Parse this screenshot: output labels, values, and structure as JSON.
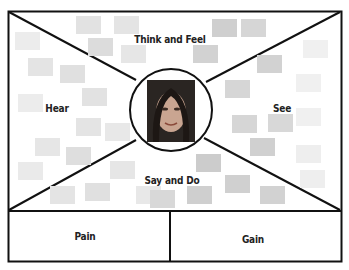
{
  "diagram": {
    "quadrants": [
      {
        "id": "think-feel",
        "label": "Think and Feel"
      },
      {
        "id": "hear",
        "label": "Hear"
      },
      {
        "id": "see",
        "label": "See"
      },
      {
        "id": "say-do",
        "label": "Say and Do"
      }
    ],
    "bottom": [
      {
        "id": "pain",
        "label": "Pain"
      },
      {
        "id": "gain",
        "label": "Gain"
      }
    ],
    "center": {
      "icon": "person-face-photo"
    },
    "colors": {
      "line": "#111111",
      "note_light": "#e6e6e6",
      "note_mid": "#d6d6d6",
      "note_dark": "#c4c4c4"
    }
  }
}
